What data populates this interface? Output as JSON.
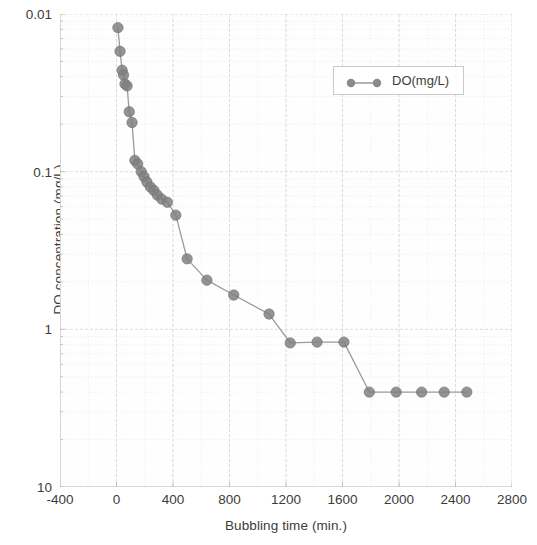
{
  "chart_data": {
    "type": "scatter",
    "title": "",
    "xlabel": "Bubbling time (min.)",
    "ylabel": "DO concentration (mg/L)",
    "yscale": "log",
    "xscale": "linear",
    "xlim": [
      -400,
      2800
    ],
    "ylim": [
      0.01,
      10
    ],
    "xticks": [
      -400,
      0,
      400,
      800,
      1200,
      1600,
      2000,
      2400,
      2800
    ],
    "yticks": [
      0.01,
      0.1,
      1,
      10
    ],
    "grid": true,
    "grid_minor": true,
    "legend_position": "upper right",
    "marker": "circle",
    "line_style": "solid",
    "series": [
      {
        "name": "DO(mg/L)",
        "color": "#808080",
        "x": [
          10,
          25,
          40,
          50,
          60,
          75,
          90,
          110,
          130,
          150,
          175,
          195,
          215,
          240,
          265,
          290,
          320,
          360,
          420,
          500,
          640,
          830,
          1080,
          1230,
          1420,
          1610,
          1790,
          1980,
          2160,
          2320,
          2480
        ],
        "y": [
          8.2,
          5.8,
          4.4,
          4.1,
          3.6,
          3.5,
          2.4,
          2.05,
          1.18,
          1.12,
          1.0,
          0.93,
          0.86,
          0.8,
          0.76,
          0.71,
          0.67,
          0.64,
          0.53,
          0.28,
          0.205,
          0.165,
          0.125,
          0.082,
          0.083,
          0.083,
          0.04,
          0.04,
          0.04,
          0.04,
          0.04
        ]
      }
    ]
  },
  "legend": {
    "entries": [
      {
        "label": "DO(mg/L)",
        "color": "#808080"
      }
    ]
  },
  "axes": {
    "y_title": "DO concentration (mg/L)",
    "x_title": "Bubbling time (min.)",
    "y_tick_labels": [
      "10",
      "1",
      "0.1",
      "0.01"
    ],
    "x_tick_labels": [
      "-400",
      "0",
      "400",
      "800",
      "1200",
      "1600",
      "2000",
      "2400",
      "2800"
    ]
  },
  "colors": {
    "marker": "#808080",
    "line": "#9a9a9a",
    "grid_major": "#d8d8d8",
    "grid_minor": "#ebebeb",
    "axis": "#bdbdbd",
    "text": "#3c3c3c"
  }
}
